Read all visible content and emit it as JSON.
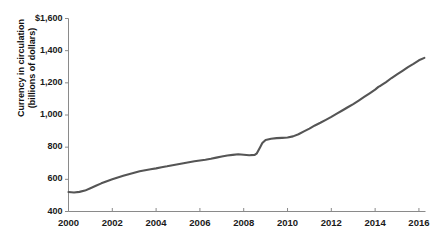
{
  "figure": {
    "top_remnant_text": " ",
    "line_color": "#555555",
    "axis_color": "#8a8a8a",
    "text_color": "#1a1a1a"
  },
  "chart_data": {
    "type": "line",
    "title": "",
    "xlabel": "",
    "ylabel": "Currency in circulation (billions of dollars)",
    "ylabel_line1": "Currency in circulation",
    "ylabel_line2": "(billions of dollars)",
    "xlim": [
      2000,
      2016.3
    ],
    "ylim": [
      400,
      1600
    ],
    "grid": false,
    "legend": "none",
    "yticks": [
      400,
      600,
      800,
      1000,
      1200,
      1400,
      1600
    ],
    "ytick_labels": [
      "400",
      "600",
      "800",
      "1,000",
      "1,200",
      "1,400",
      "$1,600"
    ],
    "xticks": [
      2000,
      2002,
      2004,
      2006,
      2008,
      2010,
      2012,
      2014,
      2016
    ],
    "xtick_labels": [
      "2000",
      "2002",
      "2004",
      "2006",
      "2008",
      "2010",
      "2012",
      "2014",
      "2016"
    ],
    "series": [
      {
        "name": "Currency in circulation",
        "units": "billions of dollars",
        "x": [
          2000.0,
          2000.25,
          2000.5,
          2000.75,
          2001.0,
          2001.25,
          2001.5,
          2001.75,
          2002.0,
          2002.25,
          2002.5,
          2002.75,
          2003.0,
          2003.25,
          2003.5,
          2003.75,
          2004.0,
          2004.25,
          2004.5,
          2004.75,
          2005.0,
          2005.25,
          2005.5,
          2005.75,
          2006.0,
          2006.25,
          2006.5,
          2006.75,
          2007.0,
          2007.25,
          2007.5,
          2007.75,
          2008.0,
          2008.25,
          2008.5,
          2008.6,
          2008.75,
          2008.85,
          2009.0,
          2009.25,
          2009.5,
          2009.75,
          2010.0,
          2010.25,
          2010.5,
          2010.75,
          2011.0,
          2011.25,
          2011.5,
          2011.75,
          2012.0,
          2012.25,
          2012.5,
          2012.75,
          2013.0,
          2013.25,
          2013.5,
          2013.75,
          2014.0,
          2014.15,
          2014.25,
          2014.5,
          2014.75,
          2015.0,
          2015.25,
          2015.5,
          2015.75,
          2016.0,
          2016.25
        ],
        "values": [
          521,
          518,
          522,
          530,
          545,
          560,
          575,
          588,
          600,
          612,
          622,
          632,
          641,
          650,
          657,
          663,
          668,
          675,
          681,
          688,
          694,
          700,
          706,
          712,
          717,
          722,
          728,
          735,
          742,
          748,
          752,
          756,
          753,
          750,
          752,
          762,
          800,
          826,
          845,
          852,
          856,
          858,
          860,
          867,
          880,
          898,
          915,
          935,
          952,
          970,
          988,
          1008,
          1028,
          1048,
          1068,
          1090,
          1112,
          1135,
          1158,
          1175,
          1182,
          1205,
          1230,
          1252,
          1275,
          1298,
          1318,
          1340,
          1355
        ]
      }
    ],
    "annotations": []
  }
}
